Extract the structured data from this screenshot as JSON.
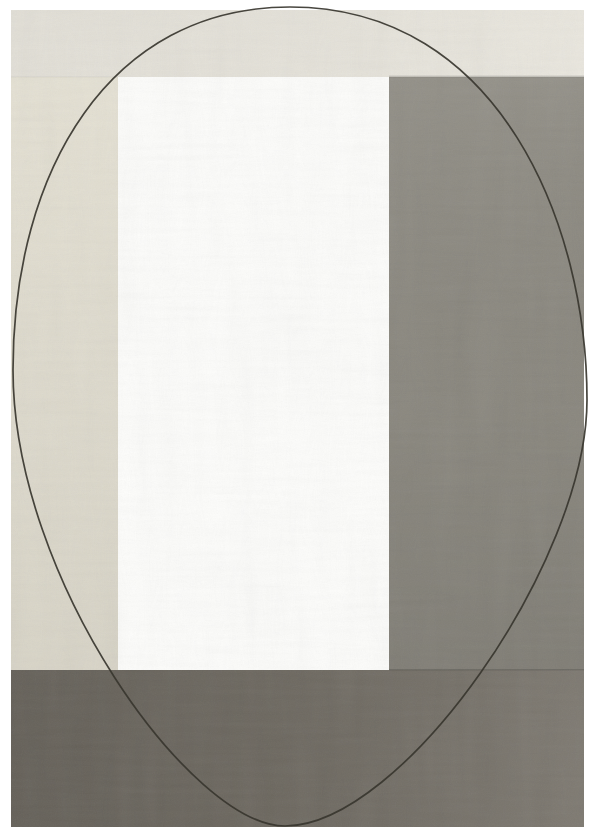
{
  "artwork": {
    "description": "Abstract panel composition with hand-drawn ellipse outline",
    "paper_color": "#ffffff",
    "panels": {
      "top_band": {
        "label": "top cream band",
        "color": "#e9e6dd"
      },
      "left_column": {
        "label": "left cream column",
        "color": "#e3dfd1"
      },
      "center_rect": {
        "label": "center white rectangle",
        "color": "#fdfdfb"
      },
      "right_column": {
        "label": "right gray-olive column",
        "color": "#8b887f"
      },
      "bottom_band": {
        "label": "bottom dark gray band",
        "color": "#716c63"
      }
    },
    "ellipse": {
      "stroke_color": "#38362f"
    }
  }
}
